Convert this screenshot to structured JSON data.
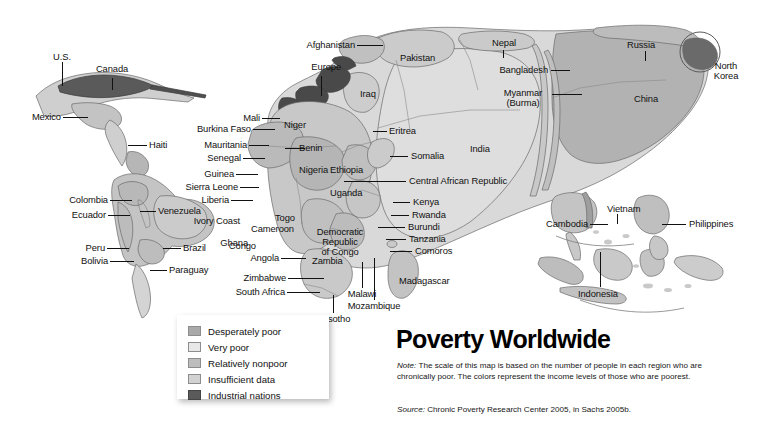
{
  "title": "Poverty Worldwide",
  "note": {
    "label": "Note:",
    "text": " The scale of this map is based on the number of people in each region who are chronically poor. The colors represent the income levels of those who are poorest."
  },
  "source": {
    "label": "Source:",
    "text": " Chronic Poverty Research Center 2005, in Sachs 2005b."
  },
  "legend": {
    "items": [
      {
        "label": "Desperately poor",
        "color": "#a9a9a9"
      },
      {
        "label": "Very poor",
        "color": "#e6e6e6"
      },
      {
        "label": "Relatively nonpoor",
        "color": "#bdbdbd"
      },
      {
        "label": "Insufficient data",
        "color": "#cfcfcf"
      },
      {
        "label": "Industrial nations",
        "color": "#5a5a5a"
      }
    ]
  },
  "map": {
    "type": "cartogram",
    "regions": {
      "americas": [
        {
          "name": "U.S.",
          "label": "U.S."
        },
        {
          "name": "Canada",
          "label": "Canada"
        },
        {
          "name": "Mexico",
          "label": "Mexico"
        },
        {
          "name": "Haiti",
          "label": "Haiti"
        },
        {
          "name": "Colombia",
          "label": "Colombia"
        },
        {
          "name": "Venezuela",
          "label": "Venezuela"
        },
        {
          "name": "Ecuador",
          "label": "Ecuador"
        },
        {
          "name": "Peru",
          "label": "Peru"
        },
        {
          "name": "Brazil",
          "label": "Brazil"
        },
        {
          "name": "Bolivia",
          "label": "Bolivia"
        },
        {
          "name": "Paraguay",
          "label": "Paraguay"
        }
      ],
      "africa": [
        {
          "name": "Mali",
          "label": "Mali"
        },
        {
          "name": "Burkina Faso",
          "label": "Burkina Faso"
        },
        {
          "name": "Mauritania",
          "label": "Mauritania"
        },
        {
          "name": "Senegal",
          "label": "Senegal"
        },
        {
          "name": "Guinea",
          "label": "Guinea"
        },
        {
          "name": "Sierra Leone",
          "label": "Sierra Leone"
        },
        {
          "name": "Liberia",
          "label": "Liberia"
        },
        {
          "name": "Ivory Coast",
          "label": "Ivory Coast"
        },
        {
          "name": "Ghana",
          "label": "Ghana"
        },
        {
          "name": "Togo",
          "label": "Togo"
        },
        {
          "name": "Niger",
          "label": "Niger"
        },
        {
          "name": "Benin",
          "label": "Benin"
        },
        {
          "name": "Nigeria",
          "label": "Nigeria"
        },
        {
          "name": "Cameroon",
          "label": "Cameroon"
        },
        {
          "name": "Congo",
          "label": "Congo"
        },
        {
          "name": "Democratic Republic of Congo",
          "label": "Democratic\nRepublic\nof Congo"
        },
        {
          "name": "Angola",
          "label": "Angola"
        },
        {
          "name": "Zambia",
          "label": "Zambia"
        },
        {
          "name": "Zimbabwe",
          "label": "Zimbabwe"
        },
        {
          "name": "South Africa",
          "label": "South Africa"
        },
        {
          "name": "Lesotho",
          "label": "Lesotho"
        },
        {
          "name": "Mozambique",
          "label": "Mozambique"
        },
        {
          "name": "Malawi",
          "label": "Malawi"
        },
        {
          "name": "Madagascar",
          "label": "Madagascar"
        },
        {
          "name": "Comoros",
          "label": "Comoros"
        },
        {
          "name": "Tanzania",
          "label": "Tanzania"
        },
        {
          "name": "Burundi",
          "label": "Burundi"
        },
        {
          "name": "Rwanda",
          "label": "Rwanda"
        },
        {
          "name": "Kenya",
          "label": "Kenya"
        },
        {
          "name": "Uganda",
          "label": "Uganda"
        },
        {
          "name": "Ethiopia",
          "label": "Ethiopia"
        },
        {
          "name": "Somalia",
          "label": "Somalia"
        },
        {
          "name": "Eritrea",
          "label": "Eritrea"
        },
        {
          "name": "Central African Republic",
          "label": "Central African Republic"
        }
      ],
      "eurasia": [
        {
          "name": "Europe",
          "label": "Europe"
        },
        {
          "name": "Iraq",
          "label": "Iraq"
        },
        {
          "name": "Afghanistan",
          "label": "Afghanistan"
        },
        {
          "name": "Pakistan",
          "label": "Pakistan"
        },
        {
          "name": "Nepal",
          "label": "Nepal"
        },
        {
          "name": "India",
          "label": "India"
        },
        {
          "name": "Bangladesh",
          "label": "Bangladesh"
        },
        {
          "name": "Myanmar (Burma)",
          "label": "Myanmar\n(Burma)"
        },
        {
          "name": "Russia",
          "label": "Russia"
        },
        {
          "name": "China",
          "label": "China"
        },
        {
          "name": "North Korea",
          "label": "North\nKorea"
        },
        {
          "name": "Vietnam",
          "label": "Vietnam"
        },
        {
          "name": "Cambodia",
          "label": "Cambodia"
        },
        {
          "name": "Philippines",
          "label": "Philippines"
        },
        {
          "name": "Indonesia",
          "label": "Indonesia"
        }
      ]
    }
  }
}
